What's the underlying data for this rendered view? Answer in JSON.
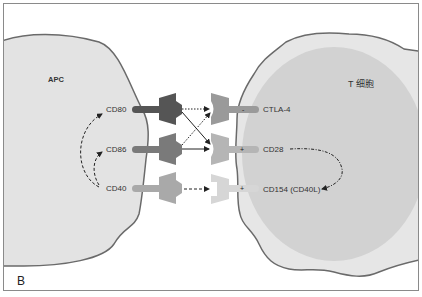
{
  "panel": {
    "letter": "B"
  },
  "cells": {
    "apc": {
      "title": "APC",
      "fill": "#e3e3e3",
      "outline": "#6a6a6a"
    },
    "tcell": {
      "title": "T 细胞",
      "outer_fill": "#e6e6e6",
      "inner_fill": "#d2d2d2",
      "outline": "#6a6a6a"
    }
  },
  "apc_molecules": [
    {
      "id": "cd80",
      "label": "CD80",
      "color": "#555555"
    },
    {
      "id": "cd86",
      "label": "CD86",
      "color": "#7a7a7a"
    },
    {
      "id": "cd40",
      "label": "CD40",
      "color": "#a9a9a9"
    }
  ],
  "tcell_molecules": [
    {
      "id": "ctla4",
      "label": "CTLA-4",
      "sign": "-",
      "color": "#9a9a9a"
    },
    {
      "id": "cd28",
      "label": "CD28",
      "sign": "+",
      "color": "#b5b5b5"
    },
    {
      "id": "cd154",
      "label": "CD154 (CD40L)",
      "sign": "+",
      "color": "#d6d6d6"
    }
  ],
  "interactions": [
    {
      "from": "CD80",
      "to": "CTLA-4",
      "style": "dotted"
    },
    {
      "from": "CD80",
      "to": "CD28",
      "style": "solid"
    },
    {
      "from": "CD86",
      "to": "CTLA-4",
      "style": "dotted"
    },
    {
      "from": "CD86",
      "to": "CD28",
      "style": "solid"
    },
    {
      "from": "CD40",
      "to": "CD154 (CD40L)",
      "style": "dashed"
    }
  ],
  "signaling_loops": [
    {
      "from": "CD40",
      "to": "CD80",
      "style": "dashed"
    },
    {
      "from": "CD40",
      "to": "CD86",
      "style": "dashed"
    },
    {
      "from": "CD28",
      "to": "CD154 (CD40L)",
      "style": "dash-dot"
    }
  ]
}
